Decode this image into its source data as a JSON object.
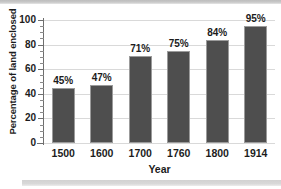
{
  "chart_data": {
    "type": "bar",
    "title": "",
    "xlabel": "Year",
    "ylabel": "Percentage of land enclosed",
    "categories": [
      "1500",
      "1600",
      "1700",
      "1760",
      "1800",
      "1914"
    ],
    "values": [
      45,
      47,
      71,
      75,
      84,
      95
    ],
    "data_labels": [
      "45%",
      "47%",
      "71%",
      "75%",
      "84%",
      "95%"
    ],
    "ylim": [
      0,
      100
    ],
    "yticks": [
      0,
      20,
      40,
      60,
      80,
      100
    ],
    "ytick_labels": [
      "0",
      "20",
      "40",
      "60",
      "80",
      "100"
    ],
    "yminor_step": 5,
    "grid": "horizontal",
    "legend": "none",
    "bar_color": "#4e4e4e",
    "bar_edge_color": "#9b9b9b",
    "grid_color": "#d9d9d9",
    "axis_color": "#6e6e6e",
    "text_color": "#1c1c1c"
  },
  "decor": {
    "band_top_color": "#c9c9c9",
    "band_bottom_color": "#d8d8d8"
  }
}
